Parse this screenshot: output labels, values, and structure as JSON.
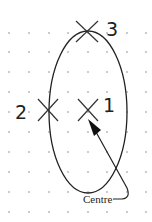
{
  "diagram": {
    "grid": {
      "columns_x": [
        9,
        29,
        49,
        68,
        88,
        107,
        127,
        146
      ],
      "rows_y": [
        33,
        52,
        72,
        92,
        112,
        132,
        152,
        172,
        192,
        212
      ],
      "dot_color": "#888888"
    },
    "ellipse": {
      "cx": 88,
      "cy": 112,
      "rx": 39,
      "ry": 81,
      "stroke": "#222222"
    },
    "points": [
      {
        "id": "3",
        "label": "3",
        "x": 87,
        "y": 31
      },
      {
        "id": "2",
        "label": "2",
        "x": 48,
        "y": 110
      },
      {
        "id": "1",
        "label": "1",
        "x": 88,
        "y": 110
      }
    ],
    "annotation": {
      "label": "Centre",
      "target": "1"
    }
  }
}
